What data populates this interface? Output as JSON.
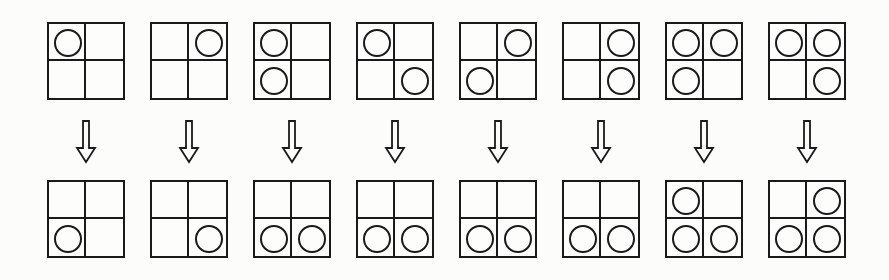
{
  "diagram": {
    "colors": {
      "stroke": "#1a1a1a",
      "background": "#fcfcfb"
    },
    "cell_order": [
      "top-left",
      "top-right",
      "bottom-left",
      "bottom-right"
    ],
    "pairs": [
      {
        "before": [
          1,
          0,
          0,
          0
        ],
        "after": [
          0,
          0,
          1,
          0
        ]
      },
      {
        "before": [
          0,
          1,
          0,
          0
        ],
        "after": [
          0,
          0,
          0,
          1
        ]
      },
      {
        "before": [
          1,
          0,
          1,
          0
        ],
        "after": [
          0,
          0,
          1,
          1
        ]
      },
      {
        "before": [
          1,
          0,
          0,
          1
        ],
        "after": [
          0,
          0,
          1,
          1
        ]
      },
      {
        "before": [
          0,
          1,
          1,
          0
        ],
        "after": [
          0,
          0,
          1,
          1
        ]
      },
      {
        "before": [
          0,
          1,
          0,
          1
        ],
        "after": [
          0,
          0,
          1,
          1
        ]
      },
      {
        "before": [
          1,
          1,
          1,
          0
        ],
        "after": [
          1,
          0,
          1,
          1
        ]
      },
      {
        "before": [
          1,
          1,
          0,
          1
        ],
        "after": [
          0,
          1,
          1,
          1
        ]
      }
    ],
    "arrow_icon": "hollow-down-arrow"
  }
}
